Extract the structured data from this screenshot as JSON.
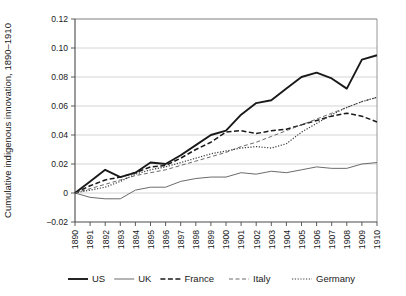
{
  "chart_data": {
    "type": "line",
    "title": "",
    "xlabel": "",
    "ylabel": "Cumulative indigenous innovation, 1890–1910",
    "x": [
      1890,
      1891,
      1892,
      1893,
      1894,
      1895,
      1896,
      1897,
      1898,
      1899,
      1900,
      1901,
      1902,
      1903,
      1904,
      1905,
      1906,
      1907,
      1908,
      1909,
      1910
    ],
    "xtick_labels": [
      "1890",
      "1891",
      "1892",
      "1893",
      "1894",
      "1895",
      "1896",
      "1897",
      "1898",
      "1899",
      "1900",
      "1901",
      "1902",
      "1903",
      "1904",
      "1905",
      "1906",
      "1907",
      "1908",
      "1909",
      "1910"
    ],
    "ytick_labels": [
      "−0.02",
      "0",
      "0.02",
      "0.04",
      "0.06",
      "0.08",
      "0.10",
      "0.12"
    ],
    "ytick_values": [
      -0.02,
      0,
      0.02,
      0.04,
      0.06,
      0.08,
      0.1,
      0.12
    ],
    "xlim": [
      1890,
      1910
    ],
    "ylim": [
      -0.02,
      0.12
    ],
    "grid": "horizontal",
    "legend_position": "bottom",
    "series": [
      {
        "name": "US",
        "style": "solid",
        "width": 1.9,
        "color": "#1a1a1a",
        "values": [
          0.0,
          0.008,
          0.016,
          0.011,
          0.014,
          0.021,
          0.02,
          0.026,
          0.033,
          0.04,
          0.043,
          0.054,
          0.062,
          0.064,
          0.072,
          0.08,
          0.083,
          0.079,
          0.072,
          0.092,
          0.095
        ]
      },
      {
        "name": "UK",
        "style": "solid",
        "width": 0.9,
        "color": "#5a5a5a",
        "values": [
          0.0,
          -0.003,
          -0.004,
          -0.004,
          0.002,
          0.004,
          0.004,
          0.008,
          0.01,
          0.011,
          0.011,
          0.014,
          0.013,
          0.015,
          0.014,
          0.016,
          0.018,
          0.017,
          0.017,
          0.02,
          0.021
        ]
      },
      {
        "name": "France",
        "style": "dashed",
        "width": 1.5,
        "color": "#1a1a1a",
        "values": [
          0.0,
          0.005,
          0.009,
          0.011,
          0.014,
          0.018,
          0.019,
          0.024,
          0.03,
          0.035,
          0.042,
          0.043,
          0.041,
          0.043,
          0.044,
          0.047,
          0.05,
          0.053,
          0.055,
          0.053,
          0.049
        ]
      },
      {
        "name": "Italy",
        "style": "dashed-thin",
        "width": 1.0,
        "color": "#6a6a6a",
        "values": [
          0.0,
          0.003,
          0.006,
          0.009,
          0.012,
          0.014,
          0.016,
          0.019,
          0.022,
          0.025,
          0.028,
          0.032,
          0.035,
          0.039,
          0.043,
          0.047,
          0.051,
          0.055,
          0.059,
          0.063,
          0.066
        ]
      },
      {
        "name": "Germany",
        "style": "dotted",
        "width": 1.2,
        "color": "#3a3a3a",
        "values": [
          0.0,
          0.002,
          0.004,
          0.008,
          0.013,
          0.016,
          0.018,
          0.021,
          0.024,
          0.027,
          0.029,
          0.031,
          0.032,
          0.031,
          0.034,
          0.042,
          0.048,
          0.054,
          0.059,
          0.063,
          0.066
        ]
      }
    ]
  },
  "legend": {
    "items": [
      {
        "label": "US"
      },
      {
        "label": "UK"
      },
      {
        "label": "France"
      },
      {
        "label": "Italy"
      },
      {
        "label": "Germany"
      }
    ]
  }
}
